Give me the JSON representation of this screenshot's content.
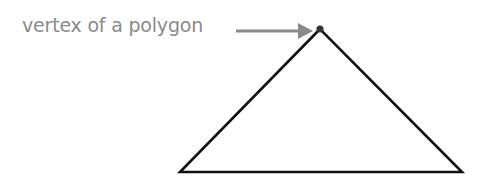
{
  "diagram": {
    "label": "vertex of a polygon",
    "colors": {
      "label": "#8a8a8a",
      "arrow": "#8a8a8a",
      "shape": "#111111",
      "vertex": "#333333"
    },
    "triangle": {
      "apex": [
        320,
        29
      ],
      "bottom_left": [
        180,
        172
      ],
      "bottom_right": [
        462,
        172
      ]
    },
    "arrow": {
      "from": [
        236,
        31
      ],
      "to": [
        312,
        31
      ]
    }
  }
}
